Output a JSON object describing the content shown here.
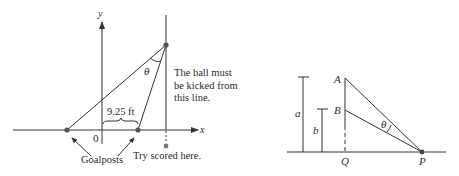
{
  "left_diagram": {
    "axis_labels": {
      "x": "x",
      "y": "y",
      "origin": "0"
    },
    "distance_label": "9.25 ft",
    "angle_label": "θ",
    "note_lines": [
      "The ball must",
      "be kicked from",
      "this line."
    ],
    "goalposts_label": "Goalposts",
    "try_label": "Try scored here."
  },
  "right_diagram": {
    "point_labels": {
      "A": "A",
      "B": "B",
      "Q": "Q",
      "P": "P"
    },
    "height_labels": {
      "a": "a",
      "b": "b"
    },
    "angle_label": "θ"
  },
  "colors": {
    "line": "#333333",
    "point": "#555555"
  }
}
